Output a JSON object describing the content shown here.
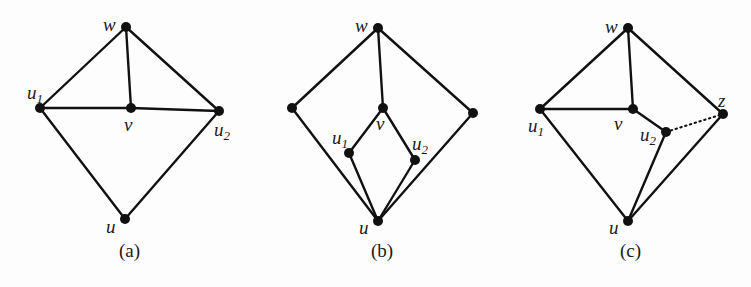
{
  "figure": {
    "panels": [
      {
        "id": "a",
        "caption": "(a)",
        "nodes": [
          {
            "id": "w",
            "x": 126,
            "y": 27,
            "label": "w",
            "sub": ""
          },
          {
            "id": "u1",
            "x": 40,
            "y": 108,
            "label": "u",
            "sub": "1"
          },
          {
            "id": "v",
            "x": 131,
            "y": 108,
            "label": "v",
            "sub": ""
          },
          {
            "id": "u2",
            "x": 219,
            "y": 111,
            "label": "u",
            "sub": "2"
          },
          {
            "id": "u",
            "x": 125,
            "y": 219,
            "label": "u",
            "sub": ""
          }
        ],
        "edges": [
          [
            "w",
            "u1"
          ],
          [
            "w",
            "v"
          ],
          [
            "w",
            "u2"
          ],
          [
            "u1",
            "v"
          ],
          [
            "v",
            "u2"
          ],
          [
            "u1",
            "u"
          ],
          [
            "u2",
            "u"
          ]
        ],
        "dotted_edges": []
      },
      {
        "id": "b",
        "caption": "(b)",
        "nodes": [
          {
            "id": "w",
            "x": 378,
            "y": 28,
            "label": "w",
            "sub": ""
          },
          {
            "id": "left",
            "x": 292,
            "y": 108,
            "label": "",
            "sub": ""
          },
          {
            "id": "v",
            "x": 383,
            "y": 108,
            "label": "v",
            "sub": ""
          },
          {
            "id": "right",
            "x": 473,
            "y": 113,
            "label": "",
            "sub": ""
          },
          {
            "id": "u1",
            "x": 349,
            "y": 153,
            "label": "u",
            "sub": "1"
          },
          {
            "id": "u2",
            "x": 415,
            "y": 160,
            "label": "u",
            "sub": "2"
          },
          {
            "id": "u",
            "x": 378,
            "y": 221,
            "label": "u",
            "sub": ""
          }
        ],
        "edges": [
          [
            "w",
            "left"
          ],
          [
            "w",
            "v"
          ],
          [
            "w",
            "right"
          ],
          [
            "left",
            "u"
          ],
          [
            "right",
            "u"
          ],
          [
            "v",
            "u1"
          ],
          [
            "v",
            "u2"
          ],
          [
            "u1",
            "u"
          ],
          [
            "u2",
            "u"
          ]
        ],
        "dotted_edges": []
      },
      {
        "id": "c",
        "caption": "(c)",
        "nodes": [
          {
            "id": "w",
            "x": 628,
            "y": 28,
            "label": "w",
            "sub": ""
          },
          {
            "id": "u1",
            "x": 540,
            "y": 109,
            "label": "u",
            "sub": "1"
          },
          {
            "id": "v",
            "x": 633,
            "y": 109,
            "label": "v",
            "sub": ""
          },
          {
            "id": "z",
            "x": 723,
            "y": 114,
            "label": "z",
            "sub": ""
          },
          {
            "id": "u2",
            "x": 666,
            "y": 132,
            "label": "u",
            "sub": "2"
          },
          {
            "id": "u",
            "x": 628,
            "y": 221,
            "label": "u",
            "sub": ""
          }
        ],
        "edges": [
          [
            "w",
            "u1"
          ],
          [
            "w",
            "v"
          ],
          [
            "w",
            "z"
          ],
          [
            "u1",
            "v"
          ],
          [
            "u1",
            "u"
          ],
          [
            "v",
            "u2"
          ],
          [
            "u2",
            "u"
          ],
          [
            "z",
            "u"
          ]
        ],
        "dotted_edges": [
          [
            "u2",
            "z"
          ]
        ]
      }
    ],
    "labels": {
      "a_w": "w",
      "a_u1": "u",
      "a_u1_sub": "1",
      "a_v": "v",
      "a_u2": "u",
      "a_u2_sub": "2",
      "a_u": "u",
      "b_w": "w",
      "b_v": "v",
      "b_u1": "u",
      "b_u1_sub": "1",
      "b_u2": "u",
      "b_u2_sub": "2",
      "b_u": "u",
      "c_w": "w",
      "c_u1": "u",
      "c_u1_sub": "1",
      "c_v": "v",
      "c_u2": "u",
      "c_u2_sub": "2",
      "c_z": "z",
      "c_u": "u",
      "cap_a": "(a)",
      "cap_b": "(b)",
      "cap_c": "(c)"
    },
    "colors": {
      "ink": "#111111",
      "background": "#fdfdfd"
    }
  }
}
